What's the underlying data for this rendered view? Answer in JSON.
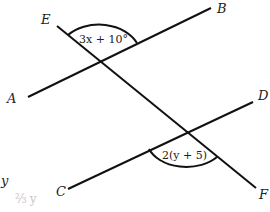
{
  "diagram": {
    "type": "two parallel lines cut by a transversal",
    "points": {
      "A": "A",
      "B": "B",
      "C": "C",
      "D": "D",
      "E": "E",
      "F": "F"
    },
    "angles": {
      "top": "3x + 10°",
      "bottom": "2(y + 5)"
    },
    "margin_notes": {
      "variable": "y",
      "faint": "2/3 y"
    },
    "colors": {
      "line": "#111111",
      "text": "#222222",
      "faint": "#c8c8c8"
    }
  }
}
